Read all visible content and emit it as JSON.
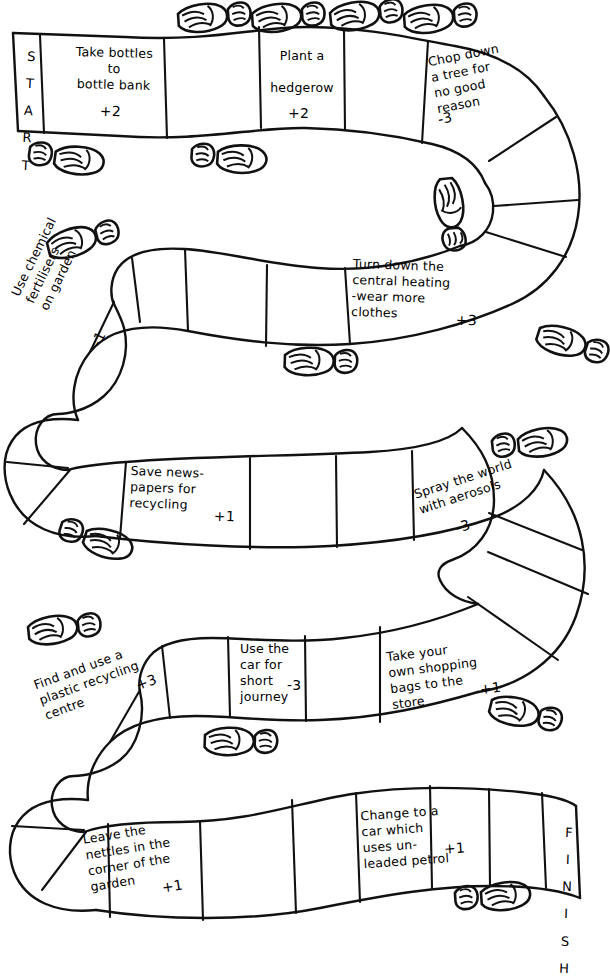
{
  "board": {
    "start_label": "START",
    "finish_label": "FINISH",
    "start_letters": [
      "S",
      "T",
      "A",
      "R",
      "T"
    ],
    "finish_letters": [
      "F",
      "I",
      "N",
      "I",
      "S",
      "H"
    ],
    "ink_color": "#111111",
    "paper_color": "#ffffff"
  },
  "spaces": [
    {
      "id": "start",
      "text": "START",
      "score": "",
      "blank": false
    },
    {
      "id": "space-1",
      "text": "Take bottles\nto\nbottle bank",
      "score": "+2",
      "blank": false
    },
    {
      "id": "space-2",
      "text": "",
      "score": "",
      "blank": true
    },
    {
      "id": "space-3",
      "text": "Plant a\nhedgerow",
      "score": "+2",
      "blank": false
    },
    {
      "id": "space-4",
      "text": "",
      "score": "",
      "blank": true
    },
    {
      "id": "space-5",
      "text": "Chop down\na tree for\nno good\nreason",
      "score": "-3",
      "blank": false
    },
    {
      "id": "space-6",
      "text": "",
      "score": "",
      "blank": true
    },
    {
      "id": "space-7",
      "text": "",
      "score": "",
      "blank": true
    },
    {
      "id": "space-8",
      "text": "",
      "score": "",
      "blank": true
    },
    {
      "id": "space-9",
      "text": "",
      "score": "",
      "blank": true
    },
    {
      "id": "space-10",
      "text": "Turn down the\ncentral heating\n-wear more\nclothes",
      "score": "+3",
      "blank": false
    },
    {
      "id": "space-11",
      "text": "",
      "score": "",
      "blank": true
    },
    {
      "id": "space-12",
      "text": "",
      "score": "",
      "blank": true
    },
    {
      "id": "space-13",
      "text": "",
      "score": "",
      "blank": true
    },
    {
      "id": "space-14",
      "text": "Use chemical\nfertilisers\non garden",
      "score": "-1",
      "blank": false
    },
    {
      "id": "space-15",
      "text": "",
      "score": "",
      "blank": true
    },
    {
      "id": "space-16",
      "text": "",
      "score": "",
      "blank": true
    },
    {
      "id": "space-17",
      "text": "Save news-\npapers for\nrecycling",
      "score": "+1",
      "blank": false
    },
    {
      "id": "space-18",
      "text": "",
      "score": "",
      "blank": true
    },
    {
      "id": "space-19",
      "text": "",
      "score": "",
      "blank": true
    },
    {
      "id": "space-20",
      "text": "Spray the world\nwith aerosols",
      "score": "-3",
      "blank": false
    },
    {
      "id": "space-21",
      "text": "",
      "score": "",
      "blank": true
    },
    {
      "id": "space-22",
      "text": "",
      "score": "",
      "blank": true
    },
    {
      "id": "space-23",
      "text": "",
      "score": "",
      "blank": true
    },
    {
      "id": "space-24",
      "text": "Take your\nown shopping\nbags to the\nstore",
      "score": "+1",
      "blank": false
    },
    {
      "id": "space-25",
      "text": "",
      "score": "",
      "blank": true
    },
    {
      "id": "space-26",
      "text": "Use the\ncar for\nshort\njourney",
      "score": "-3",
      "blank": false
    },
    {
      "id": "space-27",
      "text": "",
      "score": "",
      "blank": true
    },
    {
      "id": "space-28",
      "text": "Find and use a\nplastic recycling\ncentre",
      "score": "+3",
      "blank": false
    },
    {
      "id": "space-29",
      "text": "",
      "score": "",
      "blank": true
    },
    {
      "id": "space-30",
      "text": "",
      "score": "",
      "blank": true
    },
    {
      "id": "space-31",
      "text": "Leave the\nnettles in the\ncorner of the\ngarden",
      "score": "+1",
      "blank": false
    },
    {
      "id": "space-32",
      "text": "",
      "score": "",
      "blank": true
    },
    {
      "id": "space-33",
      "text": "",
      "score": "",
      "blank": true
    },
    {
      "id": "space-34",
      "text": "Change to a\ncar which\nuses un-\nleaded petrol",
      "score": "+1",
      "blank": false
    },
    {
      "id": "space-35",
      "text": "",
      "score": "",
      "blank": true
    },
    {
      "id": "space-36",
      "text": "",
      "score": "",
      "blank": true
    },
    {
      "id": "finish",
      "text": "FINISH",
      "score": "",
      "blank": false
    }
  ],
  "labels": {
    "take_bottles": "Take bottles\nto\nbottle bank",
    "take_bottles_score": "+2",
    "plant_hedgerow": "Plant a\n\nhedgerow",
    "plant_hedgerow_score": "+2",
    "chop_tree": "Chop down\na tree for\nno good\nreason",
    "chop_tree_score": "-3",
    "central_heating": "Turn down the\ncentral heating\n-wear more\nclothes",
    "central_heating_score": "+3",
    "fertilisers": "Use chemical\nfertilisers\non garden",
    "fertilisers_score": "-1",
    "newspapers": "Save news-\npapers for\nrecycling",
    "newspapers_score": "+1",
    "aerosols": "Spray the world\nwith aerosols",
    "aerosols_score": "-3",
    "shopping_bags": "Take your\nown shopping\nbags to the\nstore",
    "shopping_bags_score": "+1",
    "car_short": "Use the\ncar for\nshort\njourney",
    "car_short_score": "-3",
    "plastic_recycling": "Find and use a\nplastic recycling\ncentre",
    "plastic_recycling_score": "+3",
    "nettles": "Leave the\nnettles in the\ncorner of the\ngarden",
    "nettles_score": "+1",
    "unleaded": "Change to a\ncar which\nuses un-\nleaded petrol",
    "unleaded_score": "+1"
  },
  "footprints": [
    {
      "id": "fp-1",
      "x": 178,
      "y": 14,
      "rot": -4,
      "dir": "right"
    },
    {
      "id": "fp-2",
      "x": 252,
      "y": 14,
      "rot": -4,
      "dir": "right"
    },
    {
      "id": "fp-3",
      "x": 330,
      "y": 13,
      "rot": -6,
      "dir": "right"
    },
    {
      "id": "fp-4",
      "x": 404,
      "y": 15,
      "rot": -4,
      "dir": "right"
    },
    {
      "id": "fp-5",
      "x": 30,
      "y": 148,
      "rot": 8,
      "dir": "left"
    },
    {
      "id": "fp-6",
      "x": 192,
      "y": 150,
      "rot": 4,
      "dir": "left"
    },
    {
      "id": "fp-7",
      "x": 452,
      "y": 178,
      "rot": 84,
      "dir": "down"
    },
    {
      "id": "fp-8",
      "x": 47,
      "y": 243,
      "rot": -14,
      "dir": "right"
    },
    {
      "id": "fp-9",
      "x": 540,
      "y": 328,
      "rot": 18,
      "dir": "right"
    },
    {
      "id": "fp-10",
      "x": 285,
      "y": 355,
      "rot": 2,
      "dir": "right"
    },
    {
      "id": "fp-11",
      "x": 492,
      "y": 442,
      "rot": -6,
      "dir": "left"
    },
    {
      "id": "fp-12",
      "x": 62,
      "y": 523,
      "rot": 18,
      "dir": "left"
    },
    {
      "id": "fp-13",
      "x": 28,
      "y": 627,
      "rot": -6,
      "dir": "right"
    },
    {
      "id": "fp-14",
      "x": 205,
      "y": 735,
      "rot": 2,
      "dir": "right"
    },
    {
      "id": "fp-15",
      "x": 492,
      "y": 700,
      "rot": 14,
      "dir": "right"
    },
    {
      "id": "fp-16",
      "x": 455,
      "y": 894,
      "rot": -4,
      "dir": "left"
    }
  ]
}
